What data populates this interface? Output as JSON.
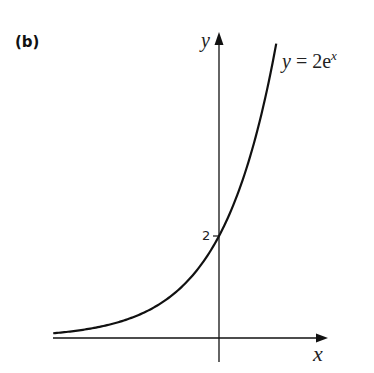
{
  "panel_label": "(b)",
  "axes": {
    "x_label": "x",
    "y_label": "y"
  },
  "equation": {
    "lhs": "y",
    "eq": " = 2e",
    "exp": "x"
  },
  "y_tick_label": "2",
  "chart_data": {
    "type": "line",
    "title": "(b)",
    "xlabel": "x",
    "ylabel": "y",
    "series": [
      {
        "name": "y = 2e^x",
        "x": [
          -3.0,
          -2.5,
          -2.0,
          -1.5,
          -1.0,
          -0.5,
          0.0,
          0.5,
          1.0,
          1.05
        ],
        "values": [
          0.1,
          0.16,
          0.27,
          0.45,
          0.74,
          1.21,
          2.0,
          3.3,
          5.44,
          5.72
        ]
      }
    ],
    "annotations": [
      {
        "text": "y = 2e^x",
        "position": "near curve top right"
      },
      {
        "text": "2",
        "position": "y-intercept tick on y-axis"
      }
    ],
    "xlim": [
      -3.07,
      2.0
    ],
    "ylim": [
      -0.5,
      6.0
    ],
    "grid": false,
    "legend": "none",
    "horizontal_asymptote": 0,
    "line_color": "#111111"
  }
}
